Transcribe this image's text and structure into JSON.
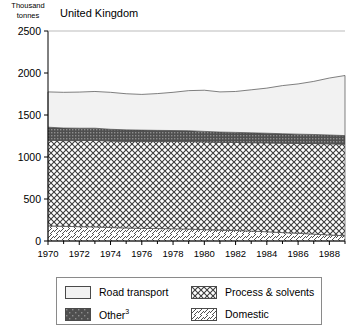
{
  "axis_unit_label": "Thousand\ntonnes",
  "title": "United Kingdom",
  "legend": {
    "items": [
      {
        "key": "road",
        "label": "Road transport",
        "swatch": "light-solid-swatch"
      },
      {
        "key": "process",
        "label": "Process & solvents",
        "swatch": "crosshatch-swatch"
      },
      {
        "key": "other",
        "label": "Other",
        "footnote": "3",
        "swatch": "dark-dotted-swatch"
      },
      {
        "key": "domestic",
        "label": "Domestic",
        "swatch": "diagonal-hatch-swatch"
      }
    ]
  },
  "colors": {
    "road": "#f2f2f2",
    "other": "#595959",
    "process": "#ffffff",
    "domestic": "#ffffff",
    "axis": "#000000",
    "outline": "#555555"
  },
  "chart_data": {
    "type": "area",
    "stacked": true,
    "title": "United Kingdom",
    "xlabel": "",
    "ylabel": "Thousand tonnes",
    "xlim": [
      1970,
      1989
    ],
    "ylim": [
      0,
      2500
    ],
    "yticks": [
      0,
      500,
      1000,
      1500,
      2000,
      2500
    ],
    "xticks": [
      1970,
      1972,
      1974,
      1976,
      1978,
      1980,
      1982,
      1984,
      1986,
      1988
    ],
    "xtick_labels": [
      "1970",
      "1972",
      "1974",
      "1976",
      "1978",
      "1980",
      "1982",
      "1984",
      "1986",
      "1988"
    ],
    "minor_xticks_every": 1,
    "grid": false,
    "legend_position": "below",
    "x": [
      1970,
      1971,
      1972,
      1973,
      1974,
      1975,
      1976,
      1977,
      1978,
      1979,
      1980,
      1981,
      1982,
      1983,
      1984,
      1985,
      1986,
      1987,
      1988,
      1989
    ],
    "series": [
      {
        "name": "Domestic",
        "order": 1,
        "values": [
          180,
          175,
          170,
          168,
          160,
          155,
          150,
          148,
          145,
          142,
          135,
          130,
          125,
          118,
          110,
          100,
          92,
          82,
          72,
          62
        ]
      },
      {
        "name": "Process & solvents",
        "order": 2,
        "values": [
          1020,
          1020,
          1025,
          1030,
          1030,
          1030,
          1035,
          1037,
          1040,
          1043,
          1045,
          1045,
          1048,
          1052,
          1058,
          1065,
          1070,
          1078,
          1085,
          1090
        ]
      },
      {
        "name": "Other",
        "order": 3,
        "values": [
          155,
          150,
          148,
          145,
          140,
          138,
          135,
          132,
          130,
          128,
          125,
          122,
          120,
          118,
          115,
          112,
          110,
          108,
          105,
          103
        ]
      },
      {
        "name": "Road transport",
        "order": 4,
        "values": [
          420,
          425,
          430,
          437,
          440,
          430,
          425,
          438,
          455,
          477,
          490,
          478,
          487,
          512,
          537,
          573,
          598,
          632,
          678,
          715
        ]
      }
    ],
    "totals": [
      1775,
      1770,
      1773,
      1780,
      1770,
      1753,
      1745,
      1755,
      1770,
      1790,
      1795,
      1775,
      1780,
      1800,
      1820,
      1850,
      1870,
      1900,
      1940,
      1970
    ],
    "annotations": []
  }
}
